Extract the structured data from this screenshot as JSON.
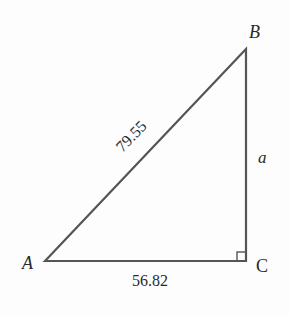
{
  "diagram": {
    "type": "right-triangle",
    "vertices": {
      "A": {
        "label": "A",
        "x": 45,
        "y": 261
      },
      "B": {
        "label": "B",
        "x": 246,
        "y": 49
      },
      "C": {
        "label": "C",
        "x": 246,
        "y": 261
      }
    },
    "sides": {
      "hypotenuse": {
        "label": "79.55",
        "from": "A",
        "to": "B"
      },
      "base": {
        "label": "56.82",
        "from": "A",
        "to": "C"
      },
      "vertical": {
        "label": "a",
        "from": "B",
        "to": "C"
      }
    },
    "right_angle_at": "C",
    "colors": {
      "line": "#555555",
      "text": "#2a2a2a"
    }
  }
}
